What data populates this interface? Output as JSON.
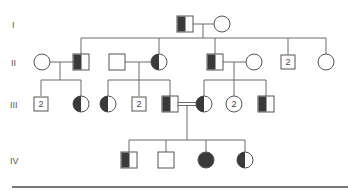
{
  "diagram": {
    "type": "pedigree",
    "generations": [
      {
        "label": "I",
        "y": 24
      },
      {
        "label": "II",
        "y": 62
      },
      {
        "label": "III",
        "y": 104
      },
      {
        "label": "IV",
        "y": 160
      }
    ],
    "individuals": [
      {
        "id": "I-1",
        "gen": "I",
        "sex": "male",
        "status": "carrier-half-filled",
        "x": 185
      },
      {
        "id": "I-2",
        "gen": "I",
        "sex": "female",
        "status": "unaffected",
        "x": 222
      },
      {
        "id": "II-1",
        "gen": "II",
        "sex": "female",
        "status": "unaffected",
        "x": 42
      },
      {
        "id": "II-2",
        "gen": "II",
        "sex": "male",
        "status": "carrier-half-filled",
        "x": 81
      },
      {
        "id": "II-3",
        "gen": "II",
        "sex": "male",
        "status": "unaffected",
        "x": 117
      },
      {
        "id": "II-4",
        "gen": "II",
        "sex": "female",
        "status": "carrier-half-filled",
        "x": 159
      },
      {
        "id": "II-5",
        "gen": "II",
        "sex": "male",
        "status": "carrier-half-filled",
        "x": 215
      },
      {
        "id": "II-6",
        "gen": "II",
        "sex": "female",
        "status": "unaffected",
        "x": 254
      },
      {
        "id": "II-7",
        "gen": "II",
        "sex": "male",
        "status": "unaffected",
        "count": "2",
        "x": 288
      },
      {
        "id": "II-8",
        "gen": "II",
        "sex": "female",
        "status": "unaffected",
        "x": 326
      },
      {
        "id": "III-1",
        "gen": "III",
        "sex": "male",
        "status": "unaffected",
        "count": "2",
        "x": 41
      },
      {
        "id": "III-2",
        "gen": "III",
        "sex": "female",
        "status": "carrier-half-filled",
        "x": 81
      },
      {
        "id": "III-3",
        "gen": "III",
        "sex": "female",
        "status": "carrier-half-filled",
        "x": 108
      },
      {
        "id": "III-4",
        "gen": "III",
        "sex": "male",
        "status": "unaffected",
        "count": "2",
        "x": 139
      },
      {
        "id": "III-5",
        "gen": "III",
        "sex": "male",
        "status": "carrier-half-filled",
        "x": 170
      },
      {
        "id": "III-6",
        "gen": "III",
        "sex": "female",
        "status": "carrier-half-filled",
        "x": 204
      },
      {
        "id": "III-7",
        "gen": "III",
        "sex": "female",
        "status": "unaffected",
        "count": "2",
        "x": 234
      },
      {
        "id": "III-8",
        "gen": "III",
        "sex": "male",
        "status": "carrier-half-filled",
        "x": 266
      },
      {
        "id": "IV-1",
        "gen": "IV",
        "sex": "male",
        "status": "carrier-half-filled",
        "x": 129
      },
      {
        "id": "IV-2",
        "gen": "IV",
        "sex": "male",
        "status": "unaffected",
        "x": 166
      },
      {
        "id": "IV-3",
        "gen": "IV",
        "sex": "female",
        "status": "affected",
        "x": 206
      },
      {
        "id": "IV-4",
        "gen": "IV",
        "sex": "female",
        "status": "carrier-half-filled",
        "x": 245
      }
    ],
    "relationships": [
      {
        "partners": [
          "I-1",
          "I-2"
        ],
        "type": "mating"
      },
      {
        "partners": [
          "II-1",
          "II-2"
        ],
        "type": "mating"
      },
      {
        "partners": [
          "II-3",
          "II-4"
        ],
        "type": "mating"
      },
      {
        "partners": [
          "II-5",
          "II-6"
        ],
        "type": "mating"
      },
      {
        "partners": [
          "III-5",
          "III-6"
        ],
        "type": "consanguineous"
      }
    ],
    "colors": {
      "line": "#6b6b6b",
      "fill": "#3a3a3a",
      "background": "#ffffff"
    }
  }
}
